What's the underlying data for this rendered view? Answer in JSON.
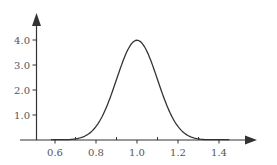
{
  "chart_data": {
    "type": "line",
    "title": "",
    "xlabel": "",
    "ylabel": "",
    "x_ticks": [
      0.6,
      0.8,
      1.0,
      1.2,
      1.4
    ],
    "x_tick_labels": [
      "0.6",
      "0.8",
      "1.0",
      "1.2",
      "1.4"
    ],
    "x_minor_ticks": [
      0.7,
      0.9,
      1.1,
      1.3
    ],
    "y_ticks": [
      1.0,
      2.0,
      3.0,
      4.0
    ],
    "y_tick_labels": [
      "1.0",
      "2.0",
      "3.0",
      "4.0"
    ],
    "xlim": [
      0.5,
      1.6
    ],
    "ylim": [
      0,
      5.0
    ],
    "grid": false,
    "legend": null,
    "series": [
      {
        "name": "normal density",
        "mean": 1.0,
        "std": 0.1,
        "x": [
          0.58,
          0.6,
          0.65,
          0.7,
          0.75,
          0.8,
          0.85,
          0.9,
          0.95,
          1.0,
          1.05,
          1.1,
          1.15,
          1.2,
          1.25,
          1.3,
          1.35,
          1.4,
          1.45
        ],
        "y": [
          0.0006,
          0.0013,
          0.0087,
          0.044,
          0.175,
          0.54,
          1.3,
          2.42,
          3.52,
          3.99,
          3.52,
          2.42,
          1.3,
          0.54,
          0.175,
          0.044,
          0.0087,
          0.0013,
          0.0002
        ]
      }
    ],
    "colors": {
      "axis": "#333333",
      "curve": "#333333",
      "labels": "#555555"
    }
  }
}
